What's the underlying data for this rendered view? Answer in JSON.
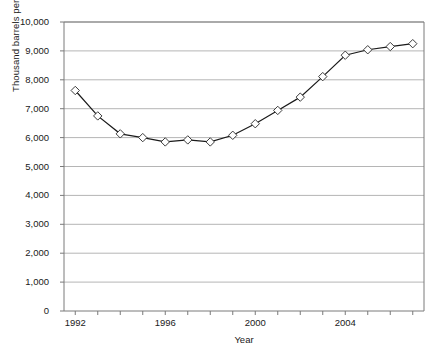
{
  "chart_data": {
    "type": "line",
    "title": "",
    "xlabel": "Year",
    "ylabel": "Thousand barrels per day",
    "xlim": [
      1991.5,
      2007.5
    ],
    "ylim": [
      0,
      10000
    ],
    "grid": true,
    "grid_axis": "y",
    "legend": false,
    "marker": "open-diamond",
    "line_color": "#1a1a1a",
    "marker_face_color": "#ffffff",
    "marker_edge_color": "#3b3b3b",
    "grid_color": "#b5b5b5",
    "axis_color": "#7a7a7a",
    "x": [
      1992,
      1993,
      1994,
      1995,
      1996,
      1997,
      1998,
      1999,
      2000,
      2001,
      2002,
      2003,
      2004,
      2005,
      2006,
      2007
    ],
    "values": [
      7630,
      6750,
      6130,
      6000,
      5850,
      5920,
      5850,
      6080,
      6480,
      6940,
      7400,
      8110,
      8850,
      9040,
      9150,
      9250
    ],
    "categories": [
      "1992",
      "1993",
      "1994",
      "1995",
      "1996",
      "1997",
      "1998",
      "1999",
      "2000",
      "2001",
      "2002",
      "2003",
      "2004",
      "2005",
      "2006",
      "2007"
    ],
    "ytick_labels": [
      "0",
      "1,000",
      "2,000",
      "3,000",
      "4,000",
      "5,000",
      "6,000",
      "7,000",
      "8,000",
      "9,000",
      "10,000"
    ],
    "ytick_values": [
      0,
      1000,
      2000,
      3000,
      4000,
      5000,
      6000,
      7000,
      8000,
      9000,
      10000
    ],
    "xtick_labels_shown": [
      "1992",
      "1996",
      "2000",
      "2004"
    ],
    "xtick_values_shown": [
      1992,
      1996,
      2000,
      2004
    ],
    "xtick_values_all": [
      1992,
      1993,
      1994,
      1995,
      1996,
      1997,
      1998,
      1999,
      2000,
      2001,
      2002,
      2003,
      2004,
      2005,
      2006,
      2007
    ]
  }
}
